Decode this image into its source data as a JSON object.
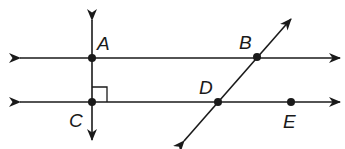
{
  "diagram": {
    "colors": {
      "stroke": "#1a1a1a",
      "background": "#ffffff"
    },
    "points": [
      {
        "id": "A",
        "label": "A",
        "x": 92,
        "y": 58
      },
      {
        "id": "B",
        "label": "B",
        "x": 257,
        "y": 57
      },
      {
        "id": "C",
        "label": "C",
        "x": 92,
        "y": 102
      },
      {
        "id": "D",
        "label": "D",
        "x": 218,
        "y": 102
      },
      {
        "id": "E",
        "label": "E",
        "x": 291,
        "y": 102
      }
    ],
    "lines": [
      {
        "id": "line-AB",
        "type": "line",
        "through": [
          "A",
          "B"
        ]
      },
      {
        "id": "line-CE",
        "type": "line",
        "through": [
          "C",
          "D",
          "E"
        ]
      },
      {
        "id": "line-AC",
        "type": "line",
        "through": [
          "A",
          "C"
        ],
        "perpendicular_to": "line-CE"
      },
      {
        "id": "line-BD",
        "type": "line",
        "through": [
          "B",
          "D"
        ]
      }
    ],
    "markers": [
      {
        "type": "right-angle",
        "at": "C"
      }
    ]
  }
}
